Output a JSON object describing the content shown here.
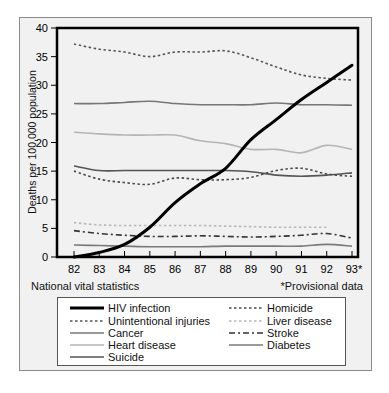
{
  "chart_data": {
    "type": "line",
    "title": "",
    "xlabel": "",
    "ylabel": "Deaths per 100,000 population",
    "x": [
      "82",
      "83",
      "84",
      "85",
      "86",
      "87",
      "88",
      "89",
      "90",
      "91",
      "92",
      "93*"
    ],
    "ylim": [
      0,
      40
    ],
    "yticks": [
      0,
      5,
      10,
      15,
      20,
      25,
      30,
      35,
      40
    ],
    "grid": false,
    "legend_position": "bottom",
    "series": [
      {
        "name": "HIV infection",
        "style": "solid-thick",
        "color": "#000000",
        "values": [
          0,
          0.8,
          2.2,
          5.2,
          9.5,
          12.8,
          15.5,
          20.5,
          24,
          27.5,
          30.5,
          33.5
        ]
      },
      {
        "name": "Unintentional injuries",
        "style": "dotted",
        "color": "#555555",
        "values": [
          37.2,
          36.3,
          35.8,
          35.0,
          35.8,
          35.8,
          36.0,
          34.8,
          33.2,
          31.8,
          31.2,
          30.9
        ]
      },
      {
        "name": "Cancer",
        "style": "solid",
        "color": "#777777",
        "values": [
          26.8,
          26.8,
          27.0,
          27.2,
          26.8,
          26.6,
          26.6,
          26.6,
          26.9,
          26.6,
          26.6,
          26.5
        ]
      },
      {
        "name": "Heart disease",
        "style": "solid",
        "color": "#b5b5b5",
        "values": [
          21.8,
          21.5,
          21.3,
          21.3,
          21.3,
          20.3,
          19.8,
          18.8,
          18.8,
          18.2,
          19.5,
          18.8
        ]
      },
      {
        "name": "Suicide",
        "style": "solid",
        "color": "#555555",
        "values": [
          15.9,
          15.1,
          15.1,
          15.1,
          15.1,
          15.1,
          15.1,
          14.9,
          14.3,
          14.1,
          14.3,
          14.7
        ]
      },
      {
        "name": "Homicide",
        "style": "dotted",
        "color": "#4a4a4a",
        "values": [
          15.0,
          13.6,
          13.0,
          12.7,
          13.8,
          13.5,
          13.5,
          13.9,
          15.1,
          15.5,
          14.5,
          14.1
        ]
      },
      {
        "name": "Liver disease",
        "style": "dotted",
        "color": "#b8b8b8",
        "values": [
          6.0,
          5.6,
          5.5,
          5.5,
          5.5,
          5.5,
          5.4,
          5.3,
          5.2,
          5.2,
          5.2,
          null
        ]
      },
      {
        "name": "Stroke",
        "style": "dash-dot",
        "color": "#333333",
        "values": [
          4.6,
          4.1,
          3.8,
          3.6,
          3.6,
          3.7,
          3.6,
          3.5,
          3.6,
          3.8,
          4.1,
          3.3
        ]
      },
      {
        "name": "Diabetes",
        "style": "solid",
        "color": "#7a7a7a",
        "values": [
          2.1,
          2.0,
          1.9,
          1.8,
          1.8,
          1.8,
          1.9,
          1.9,
          1.9,
          1.9,
          2.2,
          1.9
        ]
      }
    ]
  },
  "footer": {
    "source": "National vital statistics",
    "note": "*Provisional data"
  },
  "legend": {
    "left": [
      "HIV infection",
      "Unintentional injuries",
      "Cancer",
      "Heart disease",
      "Suicide"
    ],
    "right": [
      "Homicide",
      "Liver disease",
      "Stroke",
      "Diabetes"
    ]
  }
}
